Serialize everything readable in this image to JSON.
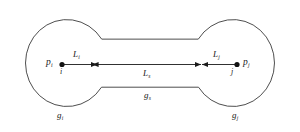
{
  "figure": {
    "stroke_color": "#3a3a3a",
    "text_color": "#1a1a1a",
    "background_color": "#ffffff"
  },
  "nodes": [
    {
      "id": "left",
      "point_label": "p",
      "point_sub": "i",
      "index_label": "i"
    },
    {
      "id": "right",
      "point_label": "p",
      "point_sub": "j",
      "index_label": "j"
    }
  ],
  "edge_labels": [
    {
      "id": "left-edge",
      "base": "L",
      "sub": "i"
    },
    {
      "id": "right-edge",
      "base": "L",
      "sub": "j"
    },
    {
      "id": "bridge-edge",
      "base": "L",
      "sub": "s"
    }
  ],
  "region_labels": [
    {
      "id": "left-region",
      "base": "g",
      "sub": "i"
    },
    {
      "id": "right-region",
      "base": "g",
      "sub": "j"
    },
    {
      "id": "bridge-region",
      "base": "g",
      "sub": "s"
    }
  ]
}
